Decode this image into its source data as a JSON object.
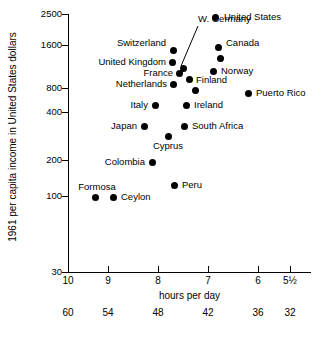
{
  "chart_data": {
    "type": "scatter",
    "title": "",
    "xlabel": "hours per day",
    "ylabel": "1961 per capita income in United States dollars",
    "xlabel_secondary": "hours per week",
    "x_axis": {
      "inverted": true,
      "ticks": [
        "10",
        "9",
        "8",
        "7",
        "6",
        "5½"
      ],
      "tick_values": [
        10,
        9,
        8,
        7,
        6,
        5.5
      ],
      "tick_px": [
        68,
        108,
        158,
        208,
        258,
        290
      ]
    },
    "x_axis_secondary": {
      "ticks": [
        "60",
        "54",
        "48",
        "42",
        "36",
        "32"
      ],
      "tick_values": [
        60,
        54,
        48,
        42,
        36,
        32
      ],
      "tick_px": [
        68,
        108,
        158,
        208,
        258,
        290
      ]
    },
    "y_axis": {
      "scale": "log",
      "ticks": [
        "2500",
        "1600",
        "800",
        "400",
        "200",
        "100",
        "30"
      ],
      "tick_values": [
        2500,
        1600,
        800,
        400,
        200,
        100,
        30
      ],
      "tick_px": [
        14,
        45,
        88,
        112,
        160,
        196,
        272
      ]
    },
    "grid": false,
    "legend": false,
    "points": [
      {
        "label": "United States",
        "x": 7.25,
        "y": 2300,
        "px": 215,
        "py": 17,
        "label_pos": "right",
        "lx": 224,
        "ly": 17
      },
      {
        "label": "Canada",
        "x": 7.05,
        "y": 1550,
        "px": 218,
        "py": 47,
        "label_pos": "right",
        "lx": 226,
        "ly": 43
      },
      {
        "label": "",
        "x": 6.95,
        "y": 1350,
        "px": 220,
        "py": 58,
        "label_pos": "none",
        "lx": 0,
        "ly": 0
      },
      {
        "label": "Switzerland",
        "x": 8.15,
        "y": 1530,
        "px": 173,
        "py": 50,
        "label_pos": "left",
        "lx": 166,
        "ly": 43
      },
      {
        "label": "United Kingdom",
        "x": 8.05,
        "y": 1230,
        "px": 172,
        "py": 62,
        "label_pos": "left",
        "lx": 166,
        "ly": 62
      },
      {
        "label": "W. Germany",
        "x": 7.75,
        "y": 1130,
        "px": 183,
        "py": 68,
        "label_pos": "leader",
        "lx": 198,
        "ly": 19
      },
      {
        "label": "France",
        "x": 7.85,
        "y": 980,
        "px": 179,
        "py": 73,
        "label_pos": "left",
        "lx": 173,
        "ly": 73
      },
      {
        "label": "Norway",
        "x": 7.0,
        "y": 1050,
        "px": 213,
        "py": 71,
        "label_pos": "right",
        "lx": 221,
        "ly": 71
      },
      {
        "label": "Finland",
        "x": 7.6,
        "y": 900,
        "px": 189,
        "py": 79,
        "label_pos": "right",
        "lx": 196,
        "ly": 80
      },
      {
        "label": "Netherlands",
        "x": 8.0,
        "y": 840,
        "px": 173,
        "py": 84,
        "label_pos": "left",
        "lx": 167,
        "ly": 84
      },
      {
        "label": "",
        "x": 7.4,
        "y": 760,
        "px": 195,
        "py": 90,
        "label_pos": "none",
        "lx": 0,
        "ly": 0
      },
      {
        "label": "Puerto Rico",
        "x": 6.2,
        "y": 750,
        "px": 248,
        "py": 93,
        "label_pos": "right",
        "lx": 256,
        "ly": 93
      },
      {
        "label": "Italy",
        "x": 8.3,
        "y": 600,
        "px": 155,
        "py": 105,
        "label_pos": "left",
        "lx": 148,
        "ly": 105
      },
      {
        "label": "Ireland",
        "x": 7.6,
        "y": 600,
        "px": 186,
        "py": 105,
        "label_pos": "right",
        "lx": 194,
        "ly": 105
      },
      {
        "label": "Japan",
        "x": 8.35,
        "y": 420,
        "px": 144,
        "py": 126,
        "label_pos": "left",
        "lx": 137,
        "ly": 126
      },
      {
        "label": "South Africa",
        "x": 7.6,
        "y": 410,
        "px": 184,
        "py": 126,
        "label_pos": "right",
        "lx": 192,
        "ly": 126
      },
      {
        "label": "Cyprus",
        "x": 7.85,
        "y": 355,
        "px": 168,
        "py": 136,
        "label_pos": "below",
        "lx": 168,
        "ly": 141
      },
      {
        "label": "Colombia",
        "x": 8.2,
        "y": 240,
        "px": 152,
        "py": 162,
        "label_pos": "left",
        "lx": 145,
        "ly": 162
      },
      {
        "label": "Peru",
        "x": 7.7,
        "y": 155,
        "px": 174,
        "py": 185,
        "label_pos": "right",
        "lx": 182,
        "ly": 185
      },
      {
        "label": "Formosa",
        "x": 9.3,
        "y": 130,
        "px": 95,
        "py": 197,
        "label_pos": "above",
        "lx": 97,
        "ly": 192
      },
      {
        "label": "Ceylon",
        "x": 8.95,
        "y": 130,
        "px": 113,
        "py": 197,
        "label_pos": "right",
        "lx": 121,
        "ly": 197
      }
    ],
    "leader_line": {
      "x1": 181,
      "y1": 66,
      "x2": 198,
      "y2": 26
    }
  }
}
